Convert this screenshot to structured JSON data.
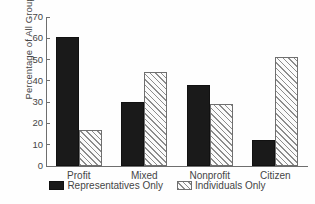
{
  "chart_data": {
    "type": "bar",
    "title": "",
    "subtitle": "",
    "xlabel": "",
    "ylabel": "Percentage of All Groups",
    "categories": [
      "Profit",
      "Mixed",
      "Nonprofit",
      "Citizen"
    ],
    "series": [
      {
        "name": "Representatives Only",
        "fill": "solid-black",
        "color": "#1a1a1a",
        "values": [
          60.5,
          30,
          38,
          12
        ]
      },
      {
        "name": "Individuals Only",
        "fill": "diagonal-hatch",
        "color": "#8c8c8c",
        "values": [
          17,
          44,
          29,
          51
        ]
      }
    ],
    "ylim": [
      0,
      70
    ],
    "yticks": [
      0,
      10,
      20,
      30,
      40,
      50,
      60,
      70
    ],
    "ytick_labels": [
      "0",
      "10",
      "20",
      "30",
      "40",
      "50",
      "60",
      "70"
    ],
    "grid": false,
    "legend_position": "below-axis-center",
    "axis_style": "left-and-bottom-spines",
    "tick_direction": "out"
  },
  "figure": {
    "background_color": "#fefefe",
    "axis_color": "#6e6e6e",
    "text_color": "#454545"
  }
}
